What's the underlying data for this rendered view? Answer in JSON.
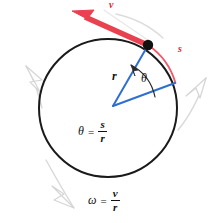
{
  "figure": {
    "background_color": "#ffffff",
    "colors": {
      "circle_stroke": "#1a1a1a",
      "radius_blue": "#2f6fd0",
      "velocity_red": "#e8414f",
      "arc_red": "#ef5a6a",
      "rotation_arrow_gray": "#cfcfcf",
      "point_black": "#111111",
      "text_black": "#111111"
    },
    "geometry": {
      "circle_center_x": 108,
      "circle_center_y": 108,
      "circle_radius": 69,
      "point_on_circle_x": 148,
      "point_on_circle_y": 45,
      "point_dot_radius": 5,
      "radius_end_x": 175,
      "radius_end_y": 82
    }
  },
  "labels": {
    "velocity": "v",
    "arc_length": "s",
    "radius": "r",
    "angle": "θ"
  },
  "equations": [
    {
      "name": "angle-equation",
      "lhs": "θ",
      "operator": "=",
      "numerator": "s",
      "denominator": "r"
    },
    {
      "name": "angular-velocity-equation",
      "lhs": "ω",
      "operator": "=",
      "numerator": "v",
      "denominator": "r"
    }
  ]
}
